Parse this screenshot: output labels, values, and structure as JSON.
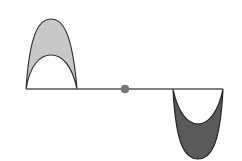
{
  "diagram": {
    "colors": {
      "background": "#ffffff",
      "string": "#555555",
      "outline": "#333333",
      "upward_pulse_fill": "#c8c8c8",
      "downward_pulse_fill": "#5a5a5a",
      "center_point": "#777777"
    },
    "string": {
      "x_start": 26,
      "x_end": 223,
      "y": 89
    },
    "pulses": [
      {
        "name": "upward-pulse",
        "direction": "up",
        "x_start": 26,
        "x_end": 77,
        "outer_peak_y": 19,
        "inner_peak_y": 55
      },
      {
        "name": "downward-pulse",
        "direction": "down",
        "x_start": 173,
        "x_end": 223,
        "outer_trough_y": 159,
        "inner_trough_y": 124
      }
    ],
    "center_point": {
      "x": 125,
      "y": 89,
      "r": 4
    }
  }
}
